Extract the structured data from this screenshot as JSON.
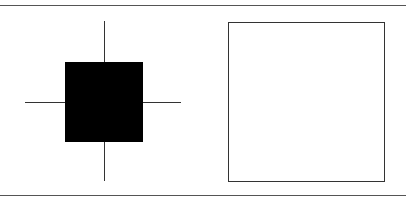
{
  "figure": {
    "left_panel": {
      "shape": "filled-square-with-crosshair",
      "fill_color": "#000000",
      "line_color": "#333333"
    },
    "right_panel": {
      "shape": "outlined-square",
      "fill_color": "#ffffff",
      "stroke_color": "#333333"
    },
    "rule_color": "#555555"
  }
}
